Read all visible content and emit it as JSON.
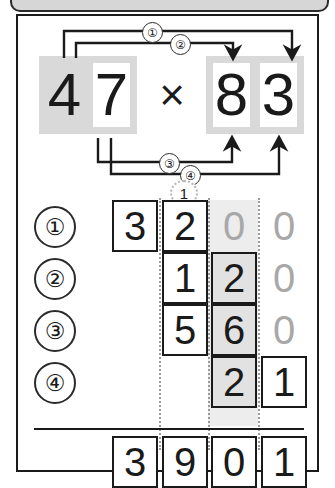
{
  "header": {
    "marks": [
      "mark-1",
      "mark-2",
      "mark-3",
      "mark-4",
      "mark-5"
    ]
  },
  "problem": {
    "multiplicand": "47",
    "multiplicand_digits": [
      "4",
      "7"
    ],
    "multiplier": "83",
    "multiplier_digits": [
      "8",
      "3"
    ],
    "operator": "×",
    "product": "3901"
  },
  "steps": [
    {
      "label": "①",
      "from_digit": "4",
      "to_digit": "8"
    },
    {
      "label": "②",
      "from_digit": "4",
      "to_digit": "3"
    },
    {
      "label": "③",
      "from_digit": "7",
      "to_digit": "8"
    },
    {
      "label": "④",
      "from_digit": "7",
      "to_digit": "3"
    }
  ],
  "carry": "1",
  "columns": {
    "headers": [
      "thousands",
      "hundreds",
      "tens",
      "ones"
    ]
  },
  "rows": [
    {
      "label": "①",
      "digits": [
        "3",
        "2",
        "0",
        "0"
      ]
    },
    {
      "label": "②",
      "digits": [
        "",
        "1",
        "2",
        "0"
      ]
    },
    {
      "label": "③",
      "digits": [
        "",
        "5",
        "6",
        "0"
      ]
    },
    {
      "label": "④",
      "digits": [
        "",
        "",
        "2",
        "1"
      ]
    }
  ],
  "total": {
    "label": "total",
    "digits": [
      "3",
      "9",
      "0",
      "1"
    ]
  },
  "colors": {
    "ink": "#1a1a1a",
    "ghost_digit": "#a8a8a8",
    "shade_light": "#d9d9d9",
    "band": "#ededed",
    "cell_gray": "#e2e2e2",
    "guide": "#9a9a9a"
  }
}
